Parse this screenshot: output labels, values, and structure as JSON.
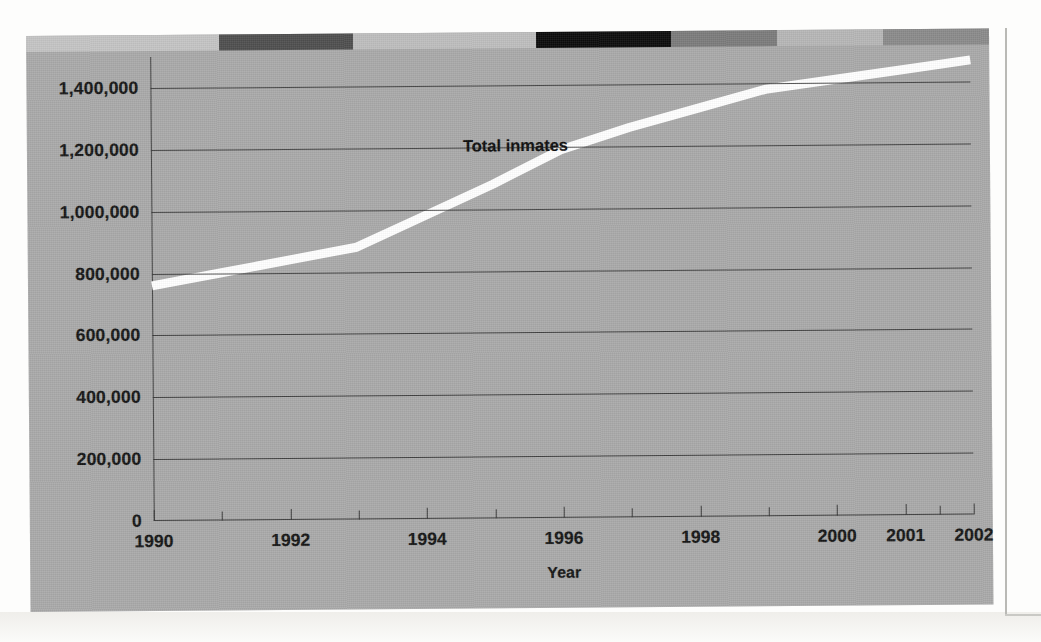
{
  "chart_data": {
    "type": "line",
    "title": "",
    "series_label": "Total inmates",
    "xlabel": "Year",
    "ylabel": "",
    "grid": true,
    "legend_position": "inline-annotation",
    "line_color": "#ffffff",
    "plot_background": "#a9a9a9",
    "xlim": [
      1990,
      2002
    ],
    "ylim": [
      0,
      1500000
    ],
    "y_ticks": [
      0,
      200000,
      400000,
      600000,
      800000,
      1000000,
      1200000,
      1400000
    ],
    "y_tick_labels": [
      "0",
      "200,000",
      "400,000",
      "600,000",
      "800,000",
      "1,000,000",
      "1,200,000",
      "1,400,000"
    ],
    "x_tick_labels": [
      "1990",
      "1992",
      "1994",
      "1996",
      "1998",
      "2000",
      "2001",
      "2002"
    ],
    "x_tick_label_positions": [
      1990,
      1992,
      1994,
      1996,
      1998,
      2000,
      2001,
      2002
    ],
    "x_minor_ticks": [
      1991,
      1993,
      1995,
      1997,
      1999,
      2001.5
    ],
    "x": [
      1990,
      1991,
      1992,
      1993,
      1994,
      1995,
      1996,
      1997,
      1998,
      1999,
      2000,
      2001,
      2002
    ],
    "values": [
      760000,
      800000,
      840000,
      880000,
      980000,
      1080000,
      1190000,
      1260000,
      1320000,
      1380000,
      1410000,
      1440000,
      1470000
    ]
  },
  "decor": {
    "top_strip_segments": [
      {
        "name": "segment-light-gray-1",
        "color": "#c4c4c4",
        "width_pct": 20
      },
      {
        "name": "segment-dark-gray",
        "color": "#4e4e4e",
        "width_pct": 14
      },
      {
        "name": "segment-light-gray-2",
        "color": "#bdbdbd",
        "width_pct": 19
      },
      {
        "name": "segment-black",
        "color": "#0b0b0b",
        "width_pct": 14
      },
      {
        "name": "segment-mid-gray",
        "color": "#7b7b7b",
        "width_pct": 11
      },
      {
        "name": "segment-light-gray-3",
        "color": "#b6b6b6",
        "width_pct": 11
      },
      {
        "name": "segment-mid-gray-2",
        "color": "#8a8a8a",
        "width_pct": 11
      }
    ]
  }
}
